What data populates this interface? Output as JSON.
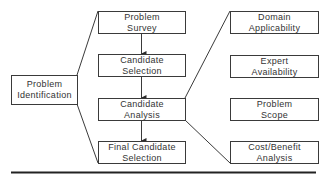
{
  "diagram": {
    "left": {
      "line1": "Problem",
      "line2": "Identification"
    },
    "middle": [
      {
        "line1": "Problem",
        "line2": "Survey"
      },
      {
        "line1": "Candidate",
        "line2": "Selection"
      },
      {
        "line1": "Candidate",
        "line2": "Analysis"
      },
      {
        "line1": "Final Candidate",
        "line2": "Selection"
      }
    ],
    "right": [
      {
        "line1": "Domain",
        "line2": "Applicability"
      },
      {
        "line1": "Expert",
        "line2": "Availability"
      },
      {
        "line1": "Problem",
        "line2": "Scope"
      },
      {
        "line1": "Cost/Benefit",
        "line2": "Analysis"
      }
    ],
    "colors": {
      "stroke": "#3a3a3a",
      "text": "#333333",
      "background": "#ffffff"
    }
  }
}
